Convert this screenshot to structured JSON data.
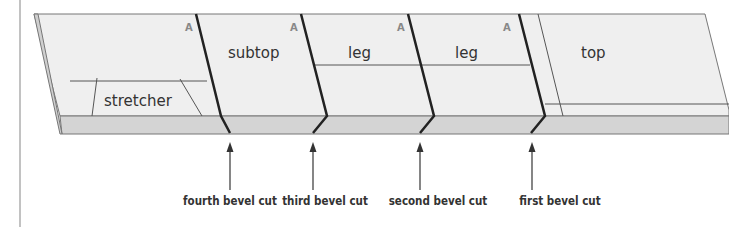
{
  "diagram": {
    "parts": [
      {
        "id": "stretcher",
        "label": "stretcher"
      },
      {
        "id": "subtop",
        "label": "subtop"
      },
      {
        "id": "leg1",
        "label": "leg"
      },
      {
        "id": "leg2",
        "label": "leg"
      },
      {
        "id": "top",
        "label": "top"
      }
    ],
    "face_marks": [
      "A",
      "A",
      "A",
      "A"
    ],
    "cuts": [
      {
        "label": "fourth bevel cut"
      },
      {
        "label": "third bevel cut"
      },
      {
        "label": "second bevel cut"
      },
      {
        "label": "first bevel cut"
      }
    ],
    "colors": {
      "top_face": "#eeeeee",
      "edge_face": "#d3d3d3",
      "outline": "#777777",
      "cut_line": "#222222"
    }
  }
}
